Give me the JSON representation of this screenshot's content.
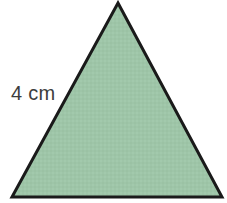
{
  "figure": {
    "kind": "geometry-diagram",
    "shape_name": "equilateral-triangle",
    "background_color": "#ffffff",
    "canvas": {
      "width": 227,
      "height": 203
    },
    "triangle": {
      "fill_color": "#9ec5a8",
      "stroke_color": "#1a1a1a",
      "stroke_width": 3,
      "vertices": {
        "apex": {
          "x": 118,
          "y": 3
        },
        "bottom_left": {
          "x": 12,
          "y": 197
        },
        "bottom_right": {
          "x": 222,
          "y": 197
        }
      },
      "points_attr": "118,3 222,197 12,197"
    },
    "labels": {
      "side_length": {
        "text": "4 cm",
        "value": "4",
        "unit": "cm",
        "color": "#3d3d3d",
        "font_size": 20,
        "position": {
          "x": 35,
          "y": 93
        },
        "describes_side": "left-side"
      }
    }
  }
}
